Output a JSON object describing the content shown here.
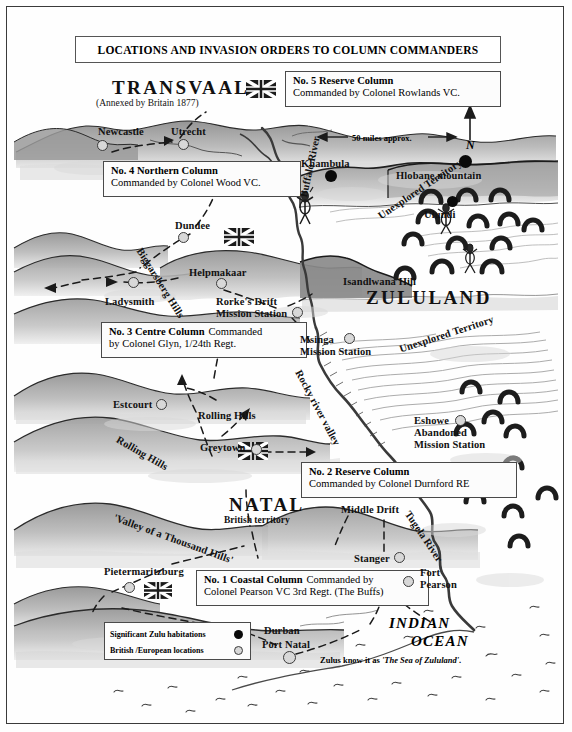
{
  "map": {
    "title": "LOCATIONS AND INVASION ORDERS TO COLUMN COMMANDERS",
    "scale_label": "50 miles  approx.",
    "compass_label": "N"
  },
  "regions": [
    {
      "name": "TRANSVAAL",
      "subtitle": "(Annexed by Britain 1877)"
    },
    {
      "name": "ZULULAND"
    },
    {
      "name": "NATAL",
      "subtitle": "British territory"
    }
  ],
  "region_transvaal": "TRANSVAAL",
  "region_transvaal_sub": "(Annexed by Britain 1877)",
  "region_zululand": "ZULULAND",
  "region_natal": "NATAL",
  "region_natal_sub": "British territory",
  "orders": [
    {
      "id": "no5",
      "title": "No. 5 Reserve Column",
      "commander": "Commanded by Colonel Rowlands VC.",
      "flag": "union-jack"
    },
    {
      "id": "no4",
      "title": "No. 4 Northern Column",
      "commander": "Commanded by  Colonel Wood VC.",
      "flag": "none"
    },
    {
      "id": "no3",
      "title": "No. 3 Centre Column",
      "title_tail": " Commanded",
      "commander": "by Colonel Glyn, 1/24th Regt.",
      "flag": "union-jack"
    },
    {
      "id": "no2",
      "title": "No. 2 Reserve Column",
      "commander": "Commanded by Colonel Durnford RE",
      "flag": "union-jack"
    },
    {
      "id": "no1",
      "title": "No. 1 Coastal Column",
      "title_tail": " Commanded by",
      "commander": "Colonel Pearson VC  3rd Regt. (The Buffs)",
      "flag": "none"
    }
  ],
  "order_no5": {
    "title": "No. 5 Reserve Column",
    "commander": "Commanded by Colonel Rowlands VC."
  },
  "order_no4": {
    "title": "No. 4 Northern Column",
    "commander": "Commanded by  Colonel Wood VC."
  },
  "order_no3": {
    "title": "No. 3 Centre Column",
    "title_tail": "Commanded",
    "commander": "by Colonel Glyn, 1/24th Regt."
  },
  "order_no2": {
    "title": "No. 2 Reserve Column",
    "commander": "Commanded by Colonel Durnford RE"
  },
  "order_no1": {
    "title": "No. 1 Coastal Column",
    "title_tail": "Commanded by",
    "commander": "Colonel Pearson VC  3rd Regt. (The Buffs)"
  },
  "places": {
    "newcastle": "Newcastle",
    "utrecht": "Utrecht",
    "khambula": "Khambula",
    "hlobane": "Hlobane mountain",
    "ulundi": "Ulundi",
    "dundee": "Dundee",
    "helpmakaar": "Helpmakaar",
    "ladysmith": "Ladysmith",
    "rorkes_drift": "Rorke's Drift",
    "rorkes_drift_2": "Mission Station",
    "isandlwana": "Isandlwana Hill",
    "msinga": "Msinga",
    "msinga_2": "Mission Station",
    "eshowe": "Eshowe",
    "eshowe_2": "Abandoned",
    "eshowe_3": "Mission Station",
    "estcourt": "Estcourt",
    "greytown": "Greytown",
    "pietermaritzburg": "Pietermaritzburg",
    "stanger": "Stanger",
    "fort_pearson": "Fort",
    "fort_pearson_2": "Pearson",
    "middle_drift": "Middle Drift",
    "durban": "Durban",
    "port_natal": "Port Natal"
  },
  "features": {
    "buffalo_river": "Buffalo River",
    "tugela_river": "Tugela River",
    "rocky_river_valley": "Rocky  river  valley",
    "biggarsberg": "Biggarsberg Hills",
    "rolling_hills_1": "Rolling Hills",
    "rolling_hills_2": "Rolling Hills",
    "thousand_hills": "'Valley of a Thousand Hills'",
    "unexplored_1": "Unexplored Territory",
    "unexplored_2": "Unexplored Territory"
  },
  "ocean": {
    "line1": "INDIAN",
    "line2": "OCEAN",
    "note_prefix": "Zulus know it as ",
    "note_name": "'The Sea of Zululand'",
    "note_suffix": "."
  },
  "legend": {
    "zulu_label": "Significant Zulu habitations",
    "british_label": "British /European locations"
  },
  "colors": {
    "terrain_dark": "#8d8d8d",
    "terrain_light": "#c9c9c9",
    "ink": "#222222",
    "zulu_dot": "#0a0a0a",
    "british_dot": "#d8d8d8",
    "flag_blue": "#16213e"
  }
}
